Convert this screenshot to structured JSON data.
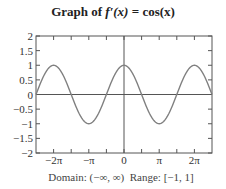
{
  "title": {
    "prefix": "Graph of ",
    "func": "f′(x)",
    "eq": " = ",
    "rhs": "cos(x)"
  },
  "caption": {
    "domain": "Domain: (−∞, ∞)",
    "range": "Range: [−1, 1]"
  },
  "chart_data": {
    "type": "line",
    "title": "Graph of f′(x) = cos(x)",
    "function": "cos(x)",
    "xlabel": "",
    "ylabel": "",
    "xlim": [
      -7.854,
      7.854
    ],
    "ylim": [
      -2,
      2
    ],
    "x_ticks": [
      "−2π",
      "−π",
      "0",
      "π",
      "2π"
    ],
    "x_tick_values": [
      -6.2832,
      -3.1416,
      0,
      3.1416,
      6.2832
    ],
    "x_minor_ticks_step": "π/2",
    "y_ticks": [
      "−2",
      "−1.5",
      "−1",
      "−0.5",
      "0",
      "0.5",
      "1",
      "1.5",
      "2"
    ],
    "y_tick_values": [
      -2,
      -1.5,
      -1,
      -0.5,
      0,
      0.5,
      1,
      1.5,
      2
    ],
    "grid": false,
    "series": [
      {
        "name": "cos(x)",
        "color": "#808080",
        "x": [
          -7.854,
          -6.2832,
          -4.7124,
          -3.1416,
          -1.5708,
          0,
          1.5708,
          3.1416,
          4.7124,
          6.2832,
          7.854
        ],
        "values": [
          0,
          1,
          0,
          -1,
          0,
          1,
          0,
          -1,
          0,
          1,
          0
        ]
      }
    ],
    "domain_text": "Domain: (−∞, ∞)",
    "range_text": "Range: [−1, 1]"
  }
}
